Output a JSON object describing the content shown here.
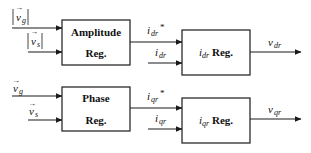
{
  "diagram": {
    "type": "control block diagram",
    "blocks": [
      {
        "id": "amplitude",
        "line1": "Amplitude",
        "line2": "Reg."
      },
      {
        "id": "idr_reg",
        "main": "i",
        "sub": "dr",
        "suffix": " Reg."
      },
      {
        "id": "phase",
        "line1": "Phase",
        "line2": "Reg."
      },
      {
        "id": "iqr_reg",
        "main": "i",
        "sub": "qr",
        "suffix": " Reg."
      }
    ],
    "signals": {
      "vg_abs": {
        "main": "v",
        "sub": "g",
        "abs": true,
        "vector": true
      },
      "vs_abs": {
        "main": "v",
        "sub": "s",
        "abs": true,
        "vector": true
      },
      "vg": {
        "main": "v",
        "sub": "g",
        "vector": true
      },
      "vs": {
        "main": "v",
        "sub": "s",
        "vector": true
      },
      "idr_ref": {
        "main": "i",
        "sub": "dr",
        "sup": "*"
      },
      "idr": {
        "main": "i",
        "sub": "dr"
      },
      "iqr_ref": {
        "main": "i",
        "sub": "qr",
        "sup": "*"
      },
      "iqr": {
        "main": "i",
        "sub": "qr"
      },
      "vdr": {
        "main": "v",
        "sub": "dr"
      },
      "vqr": {
        "main": "v",
        "sub": "qr"
      }
    },
    "colors": {
      "stroke": "#1a1a1a",
      "text": "#111111",
      "background": "#ffffff"
    }
  }
}
